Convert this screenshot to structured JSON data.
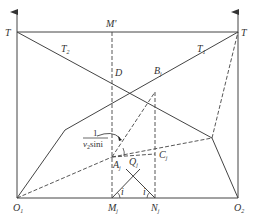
{
  "diagram": {
    "type": "time-distance refraction construction",
    "colors": {
      "line": "#444444",
      "background": "#ffffff"
    },
    "labels": {
      "T_left": "T",
      "T_right": "T",
      "M_prime": "M'",
      "T2": "T",
      "T2_sub": "2",
      "T1": "T",
      "T1_sub": "1",
      "D": "D",
      "B": "B",
      "B_sub": "j",
      "A": "A",
      "A_sub": "j",
      "C": "C",
      "C_sub": "j",
      "Q": "Q",
      "Q_sub": "j",
      "O1": "O",
      "O1_sub": "1",
      "O2": "O",
      "O2_sub": "2",
      "M": "M",
      "M_sub": "j",
      "N": "N",
      "N_sub": "j",
      "angle_left": "i",
      "angle_right": "i",
      "fraction_numerator": "1",
      "fraction_denominator": "v",
      "fraction_den_sub": "2",
      "fraction_den_rest": "sini"
    },
    "points": {
      "T_left": [
        17,
        32
      ],
      "T_right": [
        238,
        32
      ],
      "O1": [
        17,
        198
      ],
      "O2": [
        238,
        198
      ],
      "M_prime": [
        112,
        32
      ],
      "D": [
        112,
        80
      ],
      "B": [
        155,
        92
      ],
      "A": [
        112,
        157
      ],
      "C": [
        155,
        154
      ],
      "Q": [
        133,
        176
      ],
      "M": [
        112,
        198
      ],
      "N": [
        155,
        198
      ],
      "T1_kink": [
        65,
        130
      ],
      "T2_kink": [
        212,
        138
      ]
    }
  }
}
